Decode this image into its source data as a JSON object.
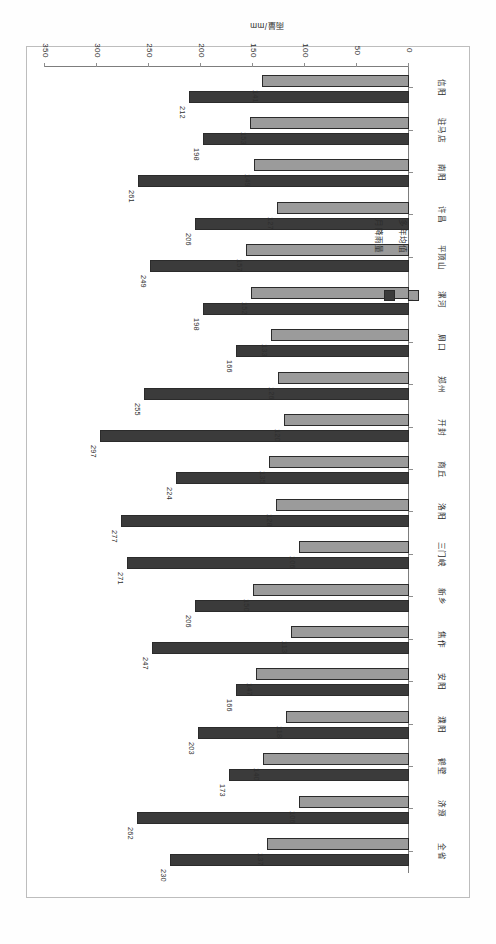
{
  "chart_data": {
    "type": "bar",
    "orientation": "horizontal",
    "title": "",
    "xlabel": "雨量/mm",
    "ylabel": "",
    "xlim": [
      0,
      350
    ],
    "xticks": [
      0,
      50,
      100,
      150,
      200,
      250,
      300,
      350
    ],
    "grid": false,
    "legend_position": "left",
    "categories": [
      "全省",
      "济源",
      "鹤壁",
      "濮阳",
      "安阳",
      "焦作",
      "新乡",
      "三门峡",
      "洛阳",
      "商丘",
      "开封",
      "郑州",
      "周口",
      "漯河",
      "平顶山",
      "许昌",
      "南阳",
      "驻马店",
      "信阳"
    ],
    "series": [
      {
        "name": "月降雨量",
        "color": "#3b3b3b",
        "values": [
          230,
          262,
          173,
          203,
          166,
          247,
          206,
          271,
          277,
          224,
          297,
          255,
          166,
          198,
          249,
          206,
          261,
          198,
          212
        ]
      },
      {
        "name": "多年均值",
        "color": "#9b9b9b",
        "values": [
          137,
          106,
          140,
          118,
          147,
          113,
          150,
          106,
          128,
          135,
          120,
          126,
          133,
          152,
          157,
          127,
          149,
          153,
          141
        ]
      }
    ]
  },
  "legend": {
    "entries": [
      {
        "label": "多年均值",
        "color": "#9b9b9b"
      },
      {
        "label": "月降雨量",
        "color": "#3b3b3b"
      }
    ]
  },
  "axis": {
    "value_title": "雨量/mm",
    "tick_labels": [
      "350",
      "300",
      "250",
      "200",
      "150",
      "100",
      "50",
      "0"
    ]
  }
}
